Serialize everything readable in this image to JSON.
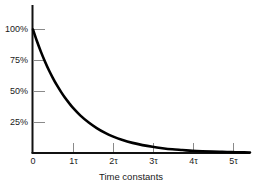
{
  "chart_data": {
    "type": "line",
    "title": "",
    "subtitle": "",
    "xlabel": "Time constants",
    "ylabel": "",
    "xlim": [
      0,
      5.45
    ],
    "ylim": [
      0,
      107
    ],
    "grid": false,
    "legend": null,
    "legend_position": "none",
    "x_tick_labels": [
      "0",
      "1τ",
      "2τ",
      "3τ",
      "4τ",
      "5τ"
    ],
    "x_tick_values": [
      0,
      1,
      2,
      3,
      4,
      5
    ],
    "y_tick_labels": [
      "25%",
      "50%",
      "75%",
      "100%"
    ],
    "y_tick_values": [
      25,
      50,
      75,
      100
    ],
    "series": [
      {
        "name": "exponential decay",
        "color": "#000000",
        "x": [
          0,
          0.1,
          0.2,
          0.3,
          0.4,
          0.5,
          0.6,
          0.7,
          0.8,
          0.9,
          1,
          1.2,
          1.4,
          1.6,
          1.8,
          2,
          2.25,
          2.5,
          2.75,
          3,
          3.25,
          3.5,
          3.75,
          4,
          4.25,
          4.5,
          4.75,
          5,
          5.25,
          5.45
        ],
        "values": [
          100,
          90.5,
          81.9,
          74.1,
          67,
          60.7,
          54.9,
          49.7,
          44.9,
          40.7,
          36.8,
          30.1,
          24.7,
          20.2,
          16.5,
          13.5,
          10.5,
          8.2,
          6.4,
          5,
          3.9,
          3,
          2.4,
          1.8,
          1.4,
          1.1,
          0.9,
          0.7,
          0.5,
          0.4
        ]
      }
    ]
  },
  "axis_titles": {
    "x": "Time constants"
  },
  "colors": {
    "curve": "#000000",
    "axis": "#111111",
    "tick": "#808080",
    "text": "#1a1a1a",
    "background": "#ffffff"
  }
}
